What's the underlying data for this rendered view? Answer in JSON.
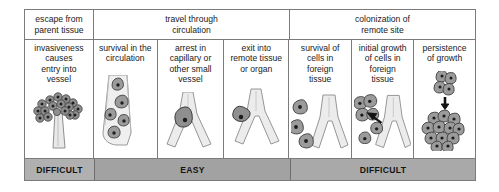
{
  "figure": {
    "groups": [
      {
        "label": "escape from\nparent tissue",
        "span": 1
      },
      {
        "label": "travel through\ncirculation",
        "span": 3
      },
      {
        "label": "colonization of\nremote site",
        "span": 3
      }
    ],
    "steps": [
      {
        "label": "invasiveness\ncauses\nentry into\nvessel",
        "art": "tumor-entering-vessel"
      },
      {
        "label": "survival in the\ncirculation",
        "art": "cells-in-vessel-lumen"
      },
      {
        "label": "arrest in\ncapillary or\nother small\nvessel",
        "art": "cell-arrested-in-capillary"
      },
      {
        "label": "exit into\nremote tissue\nor organ",
        "art": "cell-exiting-vessel"
      },
      {
        "label": "survival of\ncells in\nforeign\ntissue",
        "art": "cells-surviving-foreign-tissue"
      },
      {
        "label": "initial growth\nof cells in\nforeign\ntissue",
        "art": "cells-initial-growth"
      },
      {
        "label": "persistence\nof growth",
        "art": "growing-colony"
      }
    ],
    "difficulty": [
      {
        "label": "DIFFICULT",
        "span": 1,
        "color": "#b0b0b0"
      },
      {
        "label": "EASY",
        "span": 3,
        "color": "#a2a2a2"
      },
      {
        "label": "DIFFICULT",
        "span": 3,
        "color": "#a9a9a9"
      }
    ],
    "colors": {
      "border": "#7b7b7b",
      "vessel_fill": "#e8e8e8",
      "vessel_stroke": "#8f8f8f",
      "cell_fill": "#9a9a9a",
      "cell_stroke": "#4d4d4d",
      "nucleus": "#262626",
      "arrow": "#1c1c1c",
      "background": "#ffffff"
    }
  }
}
